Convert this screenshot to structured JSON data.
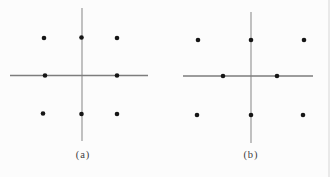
{
  "colors": {
    "background": "#fcfcfc",
    "axis_line": "#7d7d7d",
    "axis_line_vertical": "#8f8f8f",
    "dot": "#161616",
    "label_text": "#3c3c3c",
    "page_edge": "#d9d9d9"
  },
  "figures": [
    {
      "label": "(a)",
      "description": "eight-dot configuration, uniform grid, no center dot",
      "lines": [
        {
          "name": "vertical-axis",
          "x1": 82,
          "y1": 8,
          "x2": 82,
          "y2": 141,
          "width": 1.1,
          "vertical": true
        },
        {
          "name": "horizontal-axis",
          "x1": 10,
          "y1": 75.5,
          "x2": 148,
          "y2": 75.5,
          "width": 1.6,
          "vertical": false
        }
      ],
      "dots": [
        [
          44,
          38
        ],
        [
          81.5,
          37.5
        ],
        [
          117,
          38
        ],
        [
          45,
          75.5
        ],
        [
          117,
          75.5
        ],
        [
          43,
          113.5
        ],
        [
          81.5,
          114
        ],
        [
          117,
          114
        ]
      ],
      "dot_radius": 2.3
    },
    {
      "label": "(b)",
      "description": "eight-dot configuration, middle-row dots pulled inward toward vertical axis",
      "lines": [
        {
          "name": "vertical-axis",
          "x1": 251,
          "y1": 12,
          "x2": 251,
          "y2": 143,
          "width": 1.1,
          "vertical": true
        },
        {
          "name": "horizontal-axis",
          "x1": 183,
          "y1": 76,
          "x2": 313,
          "y2": 76,
          "width": 1.6,
          "vertical": false
        }
      ],
      "dots": [
        [
          198,
          40
        ],
        [
          251,
          40
        ],
        [
          304,
          40
        ],
        [
          223,
          76
        ],
        [
          277,
          76
        ],
        [
          197,
          115
        ],
        [
          251,
          115
        ],
        [
          303,
          115
        ]
      ],
      "dot_radius": 2.3
    }
  ]
}
